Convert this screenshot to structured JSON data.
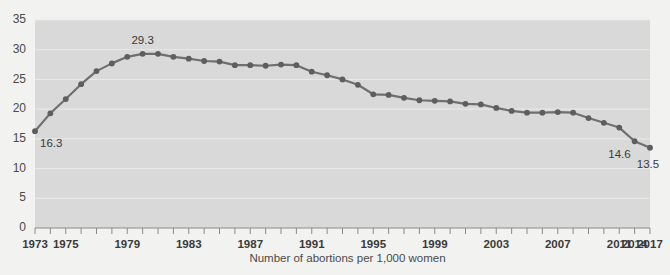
{
  "chart_data": {
    "type": "line",
    "title": "",
    "subtitle": "",
    "xlabel": "Number of abortions per 1,000 women",
    "ylabel": "",
    "xlim": [
      1973,
      2017
    ],
    "ylim": [
      0,
      35
    ],
    "grid": true,
    "legend_position": "none",
    "series_name": "Abortion rate",
    "line_color": "#6f6f6f",
    "marker_color": "#5e5e5e",
    "plot_bg_color": "#d9d9d9",
    "page_bg_color": "#f2f2f0",
    "y_ticks": [
      0,
      5,
      10,
      15,
      20,
      25,
      30,
      35
    ],
    "y_tick_labels": [
      "0",
      "5",
      "10",
      "15",
      "20",
      "25",
      "30",
      "35"
    ],
    "x_tick_years": [
      1973,
      1974,
      1975,
      1976,
      1977,
      1978,
      1979,
      1980,
      1981,
      1982,
      1983,
      1984,
      1985,
      1986,
      1987,
      1988,
      1989,
      1990,
      1991,
      1992,
      1993,
      1994,
      1995,
      1996,
      1997,
      1998,
      1999,
      2000,
      2001,
      2002,
      2003,
      2004,
      2005,
      2006,
      2007,
      2008,
      2009,
      2010,
      2011,
      2014,
      2017
    ],
    "x_labeled_years": [
      1973,
      1975,
      1979,
      1983,
      1987,
      1991,
      1995,
      1999,
      2003,
      2007,
      2011,
      2014,
      2017
    ],
    "x_tick_labels": [
      "1973",
      "1975",
      "1979",
      "1983",
      "1987",
      "1991",
      "1995",
      "1999",
      "2003",
      "2007",
      "2011",
      "2014",
      "2017"
    ],
    "x": [
      1973,
      1974,
      1975,
      1976,
      1977,
      1978,
      1979,
      1980,
      1981,
      1982,
      1983,
      1984,
      1985,
      1986,
      1987,
      1988,
      1989,
      1990,
      1991,
      1992,
      1993,
      1994,
      1995,
      1996,
      1997,
      1998,
      1999,
      2000,
      2001,
      2002,
      2003,
      2004,
      2005,
      2006,
      2007,
      2008,
      2009,
      2010,
      2011,
      2014,
      2017
    ],
    "values": [
      16.3,
      19.3,
      21.7,
      24.2,
      26.4,
      27.7,
      28.8,
      29.3,
      29.3,
      28.8,
      28.5,
      28.1,
      28.0,
      27.4,
      27.4,
      27.3,
      27.5,
      27.4,
      26.3,
      25.7,
      25.0,
      24.1,
      22.5,
      22.4,
      21.9,
      21.5,
      21.4,
      21.3,
      20.9,
      20.8,
      20.2,
      19.7,
      19.4,
      19.4,
      19.5,
      19.4,
      18.5,
      17.7,
      16.9,
      14.6,
      13.5
    ],
    "annotations": [
      {
        "year": 1973,
        "value": 16.3,
        "label": "16.3",
        "position": "below-right"
      },
      {
        "year": 1980,
        "value": 29.3,
        "label": "29.3",
        "position": "above"
      },
      {
        "year": 2014,
        "value": 14.6,
        "label": "14.6",
        "position": "below-left"
      },
      {
        "year": 2017,
        "value": 13.5,
        "label": "13.5",
        "position": "below"
      }
    ]
  }
}
